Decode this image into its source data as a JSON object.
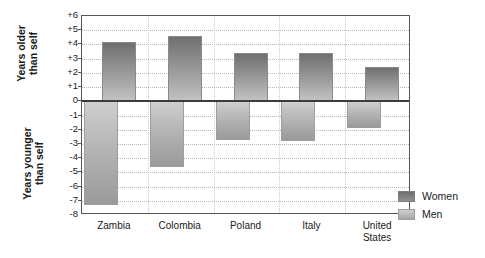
{
  "chart_data": {
    "type": "bar",
    "title": "",
    "subtitle": "",
    "xlabel": "",
    "ylabel_positive": "Years older\nthan self",
    "ylabel_negative": "Years younger\nthan self",
    "categories": [
      "Zambia",
      "Colombia",
      "Poland",
      "Italy",
      "United\nStates"
    ],
    "series": [
      {
        "name": "Women",
        "values": [
          4.2,
          4.6,
          3.4,
          3.4,
          2.4
        ],
        "color": "#8c8c8c"
      },
      {
        "name": "Men",
        "values": [
          -7.3,
          -4.6,
          -2.7,
          -2.8,
          -1.9
        ],
        "color": "#bdbdbd"
      }
    ],
    "ylim": [
      -8,
      6
    ],
    "yticks": [
      "+6",
      "+5",
      "+4",
      "+3",
      "+2",
      "+1",
      "0",
      "-1",
      "-2",
      "-3",
      "-4",
      "-5",
      "-6",
      "-7",
      "-8"
    ],
    "ytick_values": [
      6,
      5,
      4,
      3,
      2,
      1,
      0,
      -1,
      -2,
      -3,
      -4,
      -5,
      -6,
      -7,
      -8
    ],
    "grid": true,
    "legend_position": "right",
    "zero_line": 0
  },
  "legend": {
    "items": [
      {
        "label": "Women"
      },
      {
        "label": "Men"
      }
    ]
  }
}
